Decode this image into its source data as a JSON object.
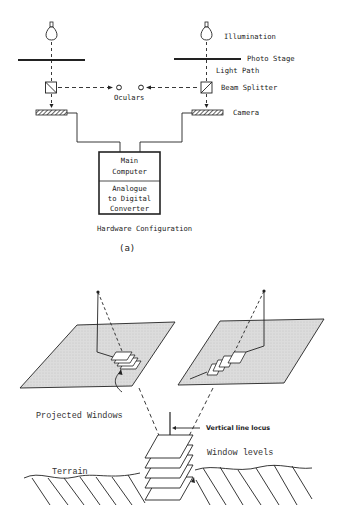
{
  "figure_a": {
    "labels": {
      "illumination": "Illumination",
      "photo_stage": "Photo Stage",
      "light_path": "Light Path",
      "beam_splitter": "Beam Splitter",
      "oculars": "Oculars",
      "camera": "Camera"
    },
    "computer_box": {
      "top_line1": "Main",
      "top_line2": "Computer",
      "bottom_line1": "Analogue",
      "bottom_line2": "to Digital",
      "bottom_line3": "Converter"
    },
    "caption": "Hardware Configuration",
    "panel_label": "(a)"
  },
  "figure_b": {
    "labels": {
      "projected_windows": "Projected Windows",
      "vertical_line_locus": "Vertical line locus",
      "window_levels": "Window levels",
      "terrain": "Terrain"
    }
  },
  "colors": {
    "ink": "#222222",
    "plane_fill": "#d9d9d9",
    "background": "#ffffff"
  }
}
